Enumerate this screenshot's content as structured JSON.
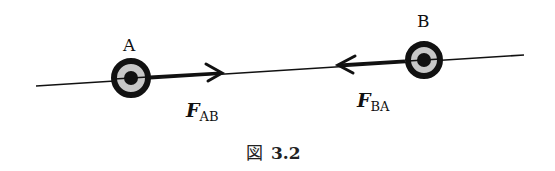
{
  "figure": {
    "caption_prefix": "図",
    "caption_number": "3.2"
  },
  "particles": [
    {
      "id": "A",
      "label": "A",
      "cx": 131,
      "cy": 78,
      "r_outer": 20,
      "r_gray": 14,
      "r_core": 7
    },
    {
      "id": "B",
      "label": "B",
      "cx": 424,
      "cy": 60,
      "r_outer": 19,
      "r_gray": 13,
      "r_core": 7
    }
  ],
  "line": {
    "x1": 36,
    "y1": 86,
    "x2": 524,
    "y2": 55
  },
  "forces": [
    {
      "id": "F_AB",
      "symbol": "F",
      "subscript": "AB",
      "direction": "A→B",
      "from_x": 150,
      "from_y": 77,
      "to_x": 222,
      "to_y": 73
    },
    {
      "id": "F_BA",
      "symbol": "F",
      "subscript": "BA",
      "direction": "B→A",
      "from_x": 405,
      "from_y": 61,
      "to_x": 338,
      "to_y": 65
    }
  ],
  "colors": {
    "ink": "#111111",
    "ring_fill": "#c8c8c8",
    "background": "#ffffff"
  }
}
